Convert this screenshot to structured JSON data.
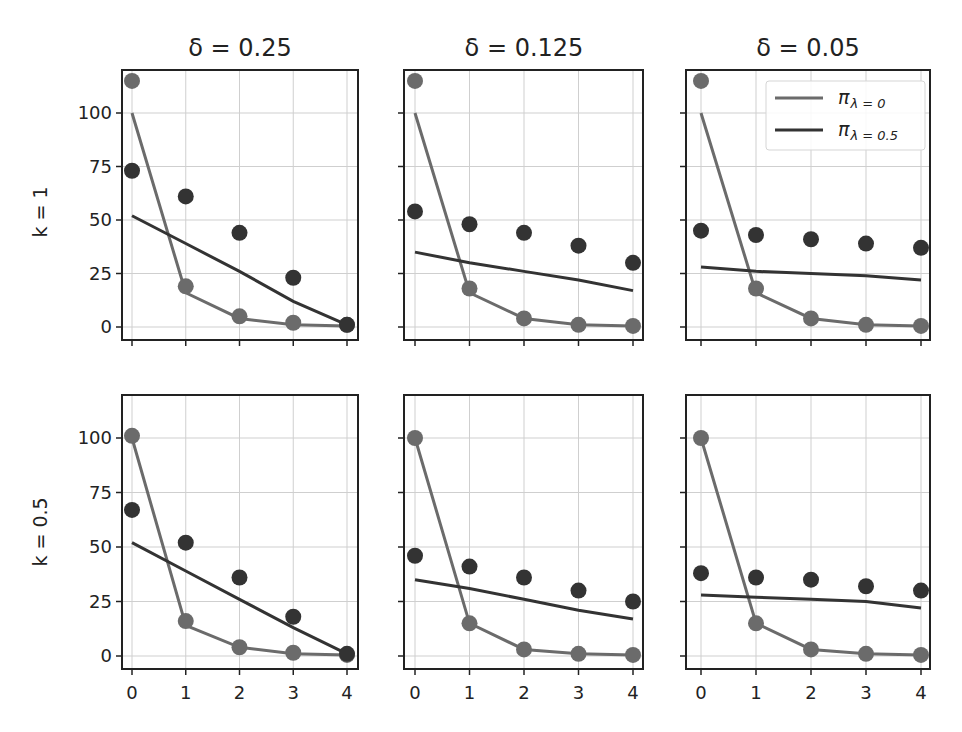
{
  "chart_data": {
    "type": "line",
    "layout": {
      "rows": 2,
      "cols": 3,
      "grid": true,
      "legend_position": "upper right of panel (row 1, col 3)"
    },
    "col_titles": [
      "δ = 0.25",
      "δ = 0.125",
      "δ = 0.05"
    ],
    "row_labels": [
      "k = 1",
      "k = 0.5"
    ],
    "x": [
      0,
      1,
      2,
      3,
      4
    ],
    "xticks": [
      "0",
      "1",
      "2",
      "3",
      "4"
    ],
    "yticks": [
      "0",
      "25",
      "50",
      "75",
      "100"
    ],
    "ylim": [
      -6,
      120
    ],
    "legend": [
      {
        "label": "π_{λ=0}",
        "main": "π",
        "sub": "λ = 0",
        "color": "#6b6b6b"
      },
      {
        "label": "π_{λ=0.5}",
        "main": "π",
        "sub": "λ = 0.5",
        "color": "#333333"
      }
    ],
    "colors": {
      "light": "#6b6b6b",
      "dark": "#333333",
      "grid": "#cfcfcf",
      "axes": "#222222"
    },
    "panels": [
      {
        "row": "k = 1",
        "col": "δ = 0.25",
        "series": [
          {
            "name": "π_{λ=0} line",
            "values": [
              100,
              16,
              4,
              1,
              0.5
            ]
          },
          {
            "name": "π_{λ=0} points",
            "values": [
              115,
              19,
              5,
              2,
              1
            ]
          },
          {
            "name": "π_{λ=0.5} line",
            "values": [
              52,
              39,
              26,
              12,
              1
            ]
          },
          {
            "name": "π_{λ=0.5} points",
            "values": [
              73,
              61,
              44,
              23,
              1
            ]
          }
        ]
      },
      {
        "row": "k = 1",
        "col": "δ = 0.125",
        "series": [
          {
            "name": "π_{λ=0} line",
            "values": [
              100,
              16,
              4,
              1,
              0.5
            ]
          },
          {
            "name": "π_{λ=0} points",
            "values": [
              115,
              18,
              4,
              1,
              0.5
            ]
          },
          {
            "name": "π_{λ=0.5} line",
            "values": [
              35,
              30,
              26,
              22,
              17
            ]
          },
          {
            "name": "π_{λ=0.5} points",
            "values": [
              54,
              48,
              44,
              38,
              30
            ]
          }
        ]
      },
      {
        "row": "k = 1",
        "col": "δ = 0.05",
        "series": [
          {
            "name": "π_{λ=0} line",
            "values": [
              100,
              16,
              4,
              1,
              0.5
            ]
          },
          {
            "name": "π_{λ=0} points",
            "values": [
              115,
              18,
              4,
              1,
              0.5
            ]
          },
          {
            "name": "π_{λ=0.5} line",
            "values": [
              28,
              26,
              25,
              24,
              22
            ]
          },
          {
            "name": "π_{λ=0.5} points",
            "values": [
              45,
              43,
              41,
              39,
              37
            ]
          }
        ]
      },
      {
        "row": "k = 0.5",
        "col": "δ = 0.25",
        "series": [
          {
            "name": "π_{λ=0} line",
            "values": [
              100,
              14,
              4,
              1,
              0.5
            ]
          },
          {
            "name": "π_{λ=0} points",
            "values": [
              101,
              16,
              4,
              1.5,
              0.5
            ]
          },
          {
            "name": "π_{λ=0.5} line",
            "values": [
              52,
              39,
              26,
              13,
              1
            ]
          },
          {
            "name": "π_{λ=0.5} points",
            "values": [
              67,
              52,
              36,
              18,
              1
            ]
          }
        ]
      },
      {
        "row": "k = 0.5",
        "col": "δ = 0.125",
        "series": [
          {
            "name": "π_{λ=0} line",
            "values": [
              100,
              15,
              3,
              1,
              0.5
            ]
          },
          {
            "name": "π_{λ=0} points",
            "values": [
              100,
              15,
              3,
              1,
              0.5
            ]
          },
          {
            "name": "π_{λ=0.5} line",
            "values": [
              35,
              31,
              26,
              21,
              17
            ]
          },
          {
            "name": "π_{λ=0.5} points",
            "values": [
              46,
              41,
              36,
              30,
              25
            ]
          }
        ]
      },
      {
        "row": "k = 0.5",
        "col": "δ = 0.05",
        "series": [
          {
            "name": "π_{λ=0} line",
            "values": [
              100,
              15,
              3,
              1,
              0.5
            ]
          },
          {
            "name": "π_{λ=0} points",
            "values": [
              100,
              15,
              3,
              1,
              0.5
            ]
          },
          {
            "name": "π_{λ=0.5} line",
            "values": [
              28,
              27,
              26,
              25,
              22
            ]
          },
          {
            "name": "π_{λ=0.5} points",
            "values": [
              38,
              36,
              35,
              32,
              30
            ]
          }
        ]
      }
    ]
  }
}
